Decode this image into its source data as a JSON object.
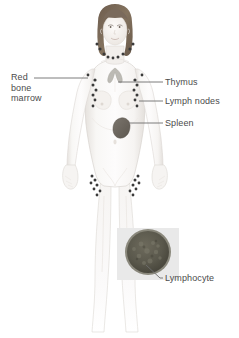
{
  "figure": {
    "background_color": "#ffffff",
    "text_color": "#4c4c4c",
    "leader_line_color": "#6e6e6e"
  },
  "labels": [
    {
      "id": "red-bone-marrow",
      "text": "Red bone marrow",
      "lines": [
        "Red",
        "bone",
        "marrow"
      ],
      "side": "left",
      "x": 11,
      "y": 74
    },
    {
      "id": "thymus",
      "text": "Thymus",
      "side": "right",
      "x": 165,
      "y": 78
    },
    {
      "id": "lymph-nodes",
      "text": "Lymph nodes",
      "side": "right",
      "x": 165,
      "y": 97
    },
    {
      "id": "spleen",
      "text": "Spleen",
      "side": "right",
      "x": 165,
      "y": 119
    },
    {
      "id": "lymphocyte",
      "text": "Lymphocyte",
      "side": "right",
      "x": 165,
      "y": 274
    }
  ],
  "organs": {
    "thymus": {
      "name": "thymus",
      "color": "#b9b9b4"
    },
    "spleen": {
      "name": "spleen",
      "color": "#6b6660"
    },
    "lymph_node_color": "#3a3a3a",
    "bone_marrow_color": "#3a3a3a"
  },
  "inset": {
    "name": "lymphocyte-inset",
    "panel_color": "#e8e8e8",
    "cell_fill": "#5c5a4e",
    "cell_rim": "#8a887c"
  },
  "body": {
    "skin_color": "#f7f5f3",
    "skin_shadow": "#e7e3df",
    "outline_color": "#d6d2ce",
    "hair_color": "#7a6a5c"
  }
}
